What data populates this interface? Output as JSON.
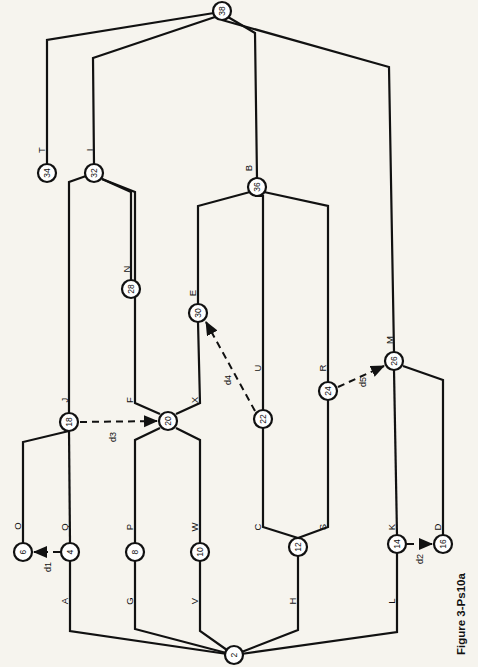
{
  "figure": {
    "caption": "Figure 3-Ps10a",
    "orientation": "rotated-90",
    "background_color": "#f6f4ee",
    "line_color": "#111111"
  },
  "chart_data": {
    "type": "diagram",
    "subtype": "activity-on-arrow network diagram (rotated 90 degrees)",
    "title": "Figure 3-Ps10a",
    "nodes": [
      {
        "id": "2",
        "label": "2",
        "x": 234,
        "y": 655,
        "r": 9
      },
      {
        "id": "4",
        "label": "4",
        "x": 70,
        "y": 552,
        "r": 9
      },
      {
        "id": "6",
        "label": "6",
        "x": 23,
        "y": 552,
        "r": 9
      },
      {
        "id": "8",
        "label": "8",
        "x": 135,
        "y": 552,
        "r": 9
      },
      {
        "id": "10",
        "label": "10",
        "x": 200,
        "y": 552,
        "r": 9
      },
      {
        "id": "12",
        "label": "12",
        "x": 298,
        "y": 547,
        "r": 9
      },
      {
        "id": "14",
        "label": "14",
        "x": 397,
        "y": 544,
        "r": 9
      },
      {
        "id": "16",
        "label": "16",
        "x": 443,
        "y": 544,
        "r": 9
      },
      {
        "id": "18",
        "label": "18",
        "x": 69,
        "y": 422,
        "r": 9
      },
      {
        "id": "20",
        "label": "20",
        "x": 168,
        "y": 421,
        "r": 9
      },
      {
        "id": "22",
        "label": "22",
        "x": 263,
        "y": 419,
        "r": 9
      },
      {
        "id": "24",
        "label": "24",
        "x": 328,
        "y": 391,
        "r": 9
      },
      {
        "id": "26",
        "label": "26",
        "x": 394,
        "y": 361,
        "r": 9
      },
      {
        "id": "28",
        "label": "28",
        "x": 131,
        "y": 289,
        "r": 9
      },
      {
        "id": "30",
        "label": "30",
        "x": 198,
        "y": 313,
        "r": 9
      },
      {
        "id": "32",
        "label": "32",
        "x": 94,
        "y": 173,
        "r": 9
      },
      {
        "id": "34",
        "label": "34",
        "x": 47,
        "y": 173,
        "r": 9
      },
      {
        "id": "36",
        "label": "36",
        "x": 257,
        "y": 187,
        "r": 9
      },
      {
        "id": "38",
        "label": "38",
        "x": 222,
        "y": 11,
        "r": 9
      }
    ],
    "activities": [
      {
        "name": "A",
        "from": "2",
        "to": "4",
        "label_x": 64,
        "label_y": 601,
        "path": "M 234 655 L 70 631 L 70 561"
      },
      {
        "name": "O",
        "from": "4",
        "to": "6",
        "label_x": 17,
        "label_y": 526,
        "path": "M 23 543 L 23 442 L 69 431"
      },
      {
        "name": "Q",
        "from": "4",
        "to": "18",
        "label_x": 64,
        "label_y": 527,
        "path": "M 70 543 L 69 431"
      },
      {
        "name": "G",
        "from": "2",
        "to": "8",
        "label_x": 129,
        "label_y": 601,
        "path": "M 234 655 L 135 629 L 135 561"
      },
      {
        "name": "P",
        "from": "8",
        "to": "20",
        "label_x": 129,
        "label_y": 527,
        "path": "M 135 543 L 135 440 L 160 428"
      },
      {
        "name": "V",
        "from": "2",
        "to": "10",
        "label_x": 194,
        "label_y": 601,
        "path": "M 234 655 L 200 631 L 200 561"
      },
      {
        "name": "W",
        "from": "10",
        "to": "20",
        "label_x": 194,
        "label_y": 527,
        "path": "M 200 543 L 200 440 L 176 428"
      },
      {
        "name": "H",
        "from": "2",
        "to": "12",
        "label_x": 292,
        "label_y": 601,
        "path": "M 234 655 L 298 630 L 298 556"
      },
      {
        "name": "C",
        "from": "12",
        "to": "22",
        "label_x": 257,
        "label_y": 527,
        "path": "M 298 538 L 263 527 L 263 428"
      },
      {
        "name": "S",
        "from": "12",
        "to": "24",
        "label_x": 322,
        "label_y": 527,
        "path": "M 298 538 L 328 527 L 328 400"
      },
      {
        "name": "L",
        "from": "2",
        "to": "14",
        "label_x": 391,
        "label_y": 601,
        "path": "M 234 655 L 397 632 L 397 553"
      },
      {
        "name": "K",
        "from": "14",
        "to": "26",
        "label_x": 391,
        "label_y": 527,
        "path": "M 397 535 L 394 370"
      },
      {
        "name": "D",
        "from": "16",
        "to": "26",
        "label_x": 437,
        "label_y": 527,
        "path": "M 443 535 L 443 380 L 403 366"
      },
      {
        "name": "F",
        "from": "20",
        "to": "32",
        "label_x": 129,
        "label_y": 400,
        "path": "M 160 414 L 135 403 L 135 192 L 102 179"
      },
      {
        "name": "X",
        "from": "20",
        "to": "30",
        "label_x": 194,
        "label_y": 400,
        "path": "M 176 414 L 200 403 L 198 322"
      },
      {
        "name": "J",
        "from": "18",
        "to": "32",
        "label_x": 64,
        "label_y": 400,
        "path": "M 69 413 L 69 182 L 86 176"
      },
      {
        "name": "N",
        "from": "28",
        "to": "32",
        "label_x": 126,
        "label_y": 269,
        "path": "M 131 280 L 131 192 L 102 179"
      },
      {
        "name": "E",
        "from": "30",
        "to": "36",
        "label_x": 192,
        "label_y": 293,
        "path": "M 198 304 L 198 206 L 250 192"
      },
      {
        "name": "U",
        "from": "22",
        "to": "36",
        "label_x": 257,
        "label_y": 368,
        "path": "M 263 410 L 263 196 L 257 196"
      },
      {
        "name": "R",
        "from": "24",
        "to": "36",
        "label_x": 322,
        "label_y": 368,
        "path": "M 328 382 L 328 206 L 264 192"
      },
      {
        "name": "M",
        "from": "26",
        "to": "38",
        "label_x": 389,
        "label_y": 340,
        "path": "M 394 352 L 389 67 L 222 20"
      },
      {
        "name": "B",
        "from": "36",
        "to": "38",
        "label_x": 248,
        "label_y": 168,
        "path": "M 257 178 L 255 33 L 228 17"
      },
      {
        "name": "I",
        "from": "32",
        "to": "38",
        "label_x": 89,
        "label_y": 150,
        "path": "M 94 164 L 93 58 L 215 17"
      },
      {
        "name": "T",
        "from": "34",
        "to": "38",
        "label_x": 41,
        "label_y": 150,
        "path": "M 47 164 L 47 40 L 214 13"
      }
    ],
    "dummy_activities": [
      {
        "name": "d1",
        "from": "4",
        "to": "6",
        "label_x": 48,
        "label_y": 567,
        "x1": 60,
        "y1": 552,
        "x2": 34,
        "y2": 552
      },
      {
        "name": "d2",
        "from": "14",
        "to": "16",
        "label_x": 420,
        "label_y": 559,
        "x1": 407,
        "y1": 544,
        "x2": 432,
        "y2": 544
      },
      {
        "name": "d3",
        "from": "18",
        "to": "20",
        "label_x": 113,
        "label_y": 437,
        "x1": 80,
        "y1": 422,
        "x2": 157,
        "y2": 421
      },
      {
        "name": "d4",
        "from": "22",
        "to": "30",
        "label_x": 228,
        "label_y": 380,
        "x1": 255,
        "y1": 411,
        "x2": 206,
        "y2": 322
      },
      {
        "name": "d5",
        "from": "24",
        "to": "26",
        "label_x": 363,
        "label_y": 382,
        "x1": 338,
        "y1": 387,
        "x2": 384,
        "y2": 366
      }
    ]
  }
}
